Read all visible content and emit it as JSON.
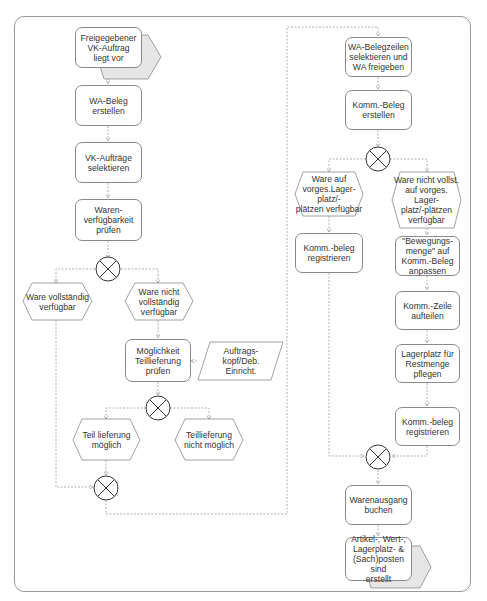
{
  "diagram": {
    "type": "EPC process chain",
    "start_event": {
      "label": "Freigegebener\nVK-Auftrag\nliegt vor"
    },
    "left_column": {
      "functions": [
        {
          "id": "wa_beleg",
          "label": "WA-Beleg\nerstellen"
        },
        {
          "id": "vk_selekt",
          "label": "VK-Aufträge\nselektieren"
        },
        {
          "id": "verfuegbarkeit",
          "label": "Waren-\nverfügbarkeit\nprüfen"
        },
        {
          "id": "teillieferung_pruefen",
          "label": "Möglichkeit\nTeillieferung prüfen"
        }
      ],
      "events": [
        {
          "id": "voll_verfuegbar",
          "label": "Ware vollständig\nverfügbar"
        },
        {
          "id": "nicht_voll_verfuegbar",
          "label": "Ware nicht\nvollständig\nverfügbar"
        },
        {
          "id": "teil_moeglich",
          "label": "Teil lieferung\nmöglich"
        },
        {
          "id": "teil_nicht_moeglich",
          "label": "Teillieferung\nnicht möglich"
        }
      ],
      "info_object": {
        "label": "Auftrags-\nkopf/Deb.\nEinricht."
      }
    },
    "right_column": {
      "functions": [
        {
          "id": "wa_belegzeilen",
          "label": "WA-Belegzeilen\nselektieren und\nWA freigeben"
        },
        {
          "id": "komm_beleg_erstellen",
          "label": "Komm.-Beleg\nerstellen"
        },
        {
          "id": "komm_reg_1",
          "label": "Komm.-beleg\nregistrieren"
        },
        {
          "id": "bewegungsmenge",
          "label": "\"Bewegungs-\nmenge\" auf\nKomm.-Beleg\nanpassen"
        },
        {
          "id": "zeile_aufteilen",
          "label": "Komm.-Zeile\naufteilen"
        },
        {
          "id": "lagerplatz_pflegen",
          "label": "Lagerplatz für\nRestmenge\npflegen"
        },
        {
          "id": "komm_reg_2",
          "label": "Komm.-beleg\nregistrieren"
        },
        {
          "id": "wa_buchen",
          "label": "Warenausgang\nbuchen"
        }
      ],
      "events": [
        {
          "id": "lager_verfuegbar",
          "label": "Ware auf\nvorges.Lager-platz/-\nplätzen verfügbar"
        },
        {
          "id": "lager_nicht_verfuegbar",
          "label": "Ware nicht vollst.\nauf vorges. Lager-\nplatz/-plätzen\nverfügbar"
        }
      ],
      "end_event": {
        "label": "Artikel-, Wert-,\nLagerplatz- &\n(Sach)posten sind\nerstellt"
      }
    },
    "connectors": [
      {
        "id": "xor1",
        "type": "XOR"
      },
      {
        "id": "xor2",
        "type": "XOR"
      },
      {
        "id": "xor3",
        "type": "XOR"
      },
      {
        "id": "xor4",
        "type": "XOR"
      },
      {
        "id": "xor5",
        "type": "XOR"
      }
    ],
    "colors": {
      "line": "#9a9a9a",
      "border": "#8a8a8a",
      "event_shadow": "#e6e6e6",
      "text": "#333333"
    }
  }
}
